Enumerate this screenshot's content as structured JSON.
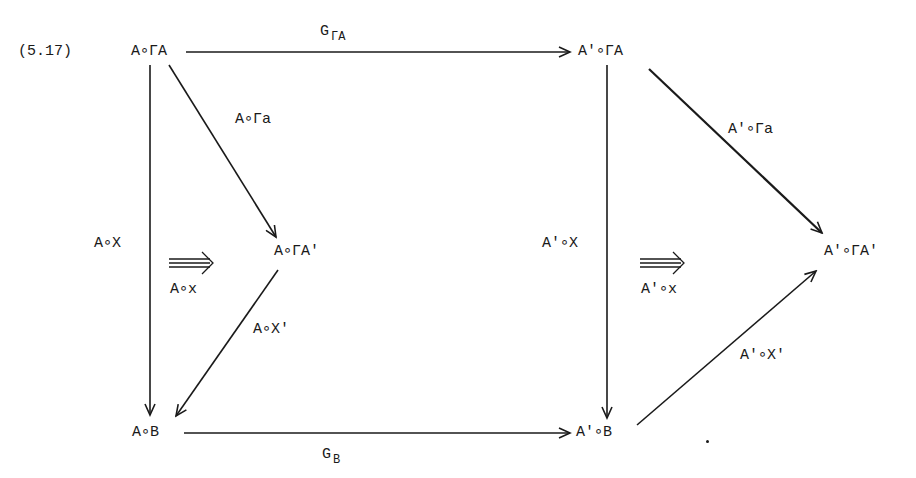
{
  "equation_number": "(5.17)",
  "nodes": {
    "top_left": "A∘ΓA",
    "top_right": "A'∘ΓA",
    "mid_left": "A∘ΓA'",
    "mid_right": "A'∘ΓA'",
    "bottom_left": "A∘B",
    "bottom_right": "A'∘B"
  },
  "morphisms": {
    "top": {
      "main": "G",
      "sub": "ΓA"
    },
    "bottom": {
      "main": "G",
      "sub": "B"
    },
    "left_vertical": "A∘X",
    "left_diag_down": "A∘Γa",
    "left_diag_up": "A∘X'",
    "right_vertical": "A'∘X",
    "right_diag_down": "A'∘Γa",
    "right_diag_up": "A'∘X'"
  },
  "two_cells": {
    "left": "A∘x",
    "right": "A'∘x"
  },
  "colors": {
    "ink": "#1a1a1a",
    "background": "#ffffff"
  }
}
